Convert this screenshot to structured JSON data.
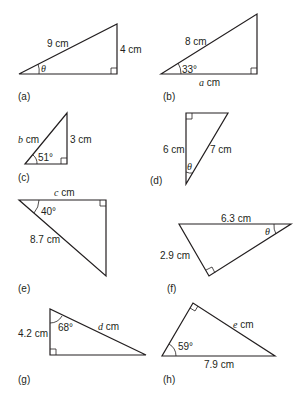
{
  "figures": {
    "a": {
      "label": "(a)",
      "hyp": "9 cm",
      "opp": "4 cm",
      "angle": "θ"
    },
    "b": {
      "label": "(b)",
      "hyp": "8 cm",
      "angle": "33°",
      "adj_var": "a",
      "adj_unit": " cm"
    },
    "c": {
      "label": "(c)",
      "hyp_var": "b",
      "hyp_unit": " cm",
      "opp": "3 cm",
      "angle": "51°"
    },
    "d": {
      "label": "(d)",
      "adj": "6 cm",
      "hyp": "7 cm",
      "angle": "θ"
    },
    "e": {
      "label": "(e)",
      "adj_var": "c",
      "adj_unit": " cm",
      "hyp": "8.7 cm",
      "angle": "40°"
    },
    "f": {
      "label": "(f)",
      "hyp": "6.3 cm",
      "opp": "2.9 cm",
      "angle": "θ"
    },
    "g": {
      "label": "(g)",
      "adj": "4.2 cm",
      "angle": "68°",
      "hyp_var": "d",
      "hyp_unit": " cm"
    },
    "h": {
      "label": "(h)",
      "opp_var": "e",
      "opp_unit": " cm",
      "hyp": "7.9 cm",
      "angle": "59°"
    }
  },
  "colors": {
    "stroke": "#231f20",
    "background": "#ffffff"
  }
}
